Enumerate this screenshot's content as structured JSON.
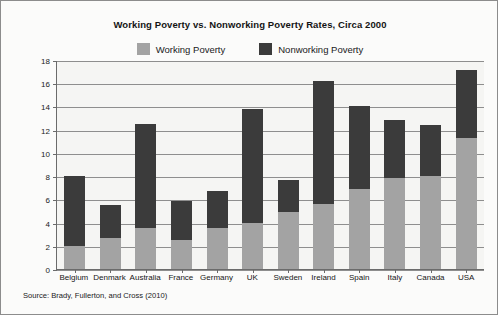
{
  "chart_data": {
    "type": "bar",
    "subtype": "stacked-bar",
    "title": "Working Poverty vs. Nonworking Poverty Rates, Circa 2000",
    "xlabel": "",
    "ylabel": "% of households in poverty",
    "ylim": [
      0,
      18
    ],
    "ytick_step": 2,
    "yticks": [
      0,
      2,
      4,
      6,
      8,
      10,
      12,
      14,
      16,
      18
    ],
    "grid": true,
    "legend_position": "top-center",
    "categories": [
      "Belgium",
      "Denmark",
      "Australia",
      "France",
      "Germany",
      "UK",
      "Sweden",
      "Ireland",
      "Spain",
      "Italy",
      "Canada",
      "USA"
    ],
    "series": [
      {
        "name": "Working Poverty",
        "color": "#a3a3a3",
        "values": [
          2.0,
          2.7,
          3.5,
          2.5,
          3.5,
          4.0,
          4.9,
          5.6,
          6.9,
          7.8,
          8.0,
          11.3
        ]
      },
      {
        "name": "Nonworking Poverty",
        "color": "#3b3b3b",
        "values": [
          6.0,
          2.8,
          9.0,
          3.4,
          3.2,
          9.8,
          2.8,
          10.6,
          7.1,
          5.0,
          4.4,
          5.8
        ]
      }
    ],
    "totals": [
      8.0,
      5.5,
      12.5,
      5.9,
      6.7,
      13.8,
      7.7,
      16.2,
      14.0,
      12.8,
      12.4,
      17.1
    ],
    "source": "Source: Brady, Fullerton, and Cross (2010)"
  },
  "legend": {
    "items": [
      {
        "label": "Working Poverty",
        "color": "#a3a3a3",
        "swatch_name": "legend-swatch-working-poverty"
      },
      {
        "label": "Nonworking Poverty",
        "color": "#3b3b3b",
        "swatch_name": "legend-swatch-nonworking-poverty"
      }
    ]
  },
  "colors": {
    "working_poverty": "#a3a3a3",
    "nonworking_poverty": "#3b3b3b",
    "plot_background": "#f5f5f3",
    "figure_background": "#fbfbfa",
    "axis": "#6b6b6b",
    "gridline": "#8e8e8e",
    "text": "#161616"
  }
}
